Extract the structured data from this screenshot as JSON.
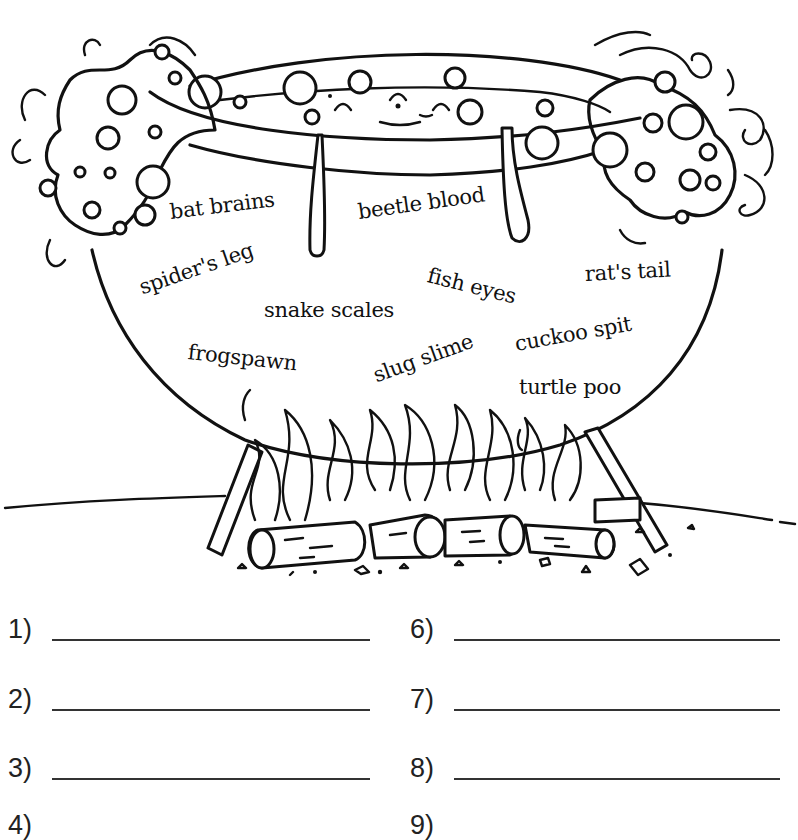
{
  "worksheet": {
    "illustration": "witch's cauldron bubbling over a log fire",
    "ingredients": [
      {
        "id": "bat-brains",
        "text": "bat brains"
      },
      {
        "id": "beetle-blood",
        "text": "beetle blood"
      },
      {
        "id": "spiders-leg",
        "text": "spider's leg"
      },
      {
        "id": "fish-eyes",
        "text": "fish eyes"
      },
      {
        "id": "rats-tail",
        "text": "rat's tail"
      },
      {
        "id": "snake-scales",
        "text": "snake scales"
      },
      {
        "id": "frogspawn",
        "text": "frogspawn"
      },
      {
        "id": "slug-slime",
        "text": "slug slime"
      },
      {
        "id": "cuckoo-spit",
        "text": "cuckoo spit"
      },
      {
        "id": "turtle-poo",
        "text": "turtle poo"
      }
    ],
    "answers": [
      {
        "number": "1)",
        "value": ""
      },
      {
        "number": "2)",
        "value": ""
      },
      {
        "number": "3)",
        "value": ""
      },
      {
        "number": "4)",
        "value": ""
      },
      {
        "number": "6)",
        "value": ""
      },
      {
        "number": "7)",
        "value": ""
      },
      {
        "number": "8)",
        "value": ""
      },
      {
        "number": "9)",
        "value": ""
      }
    ]
  },
  "colors": {
    "ink": "#111111",
    "paper": "#ffffff",
    "line": "#333333"
  }
}
